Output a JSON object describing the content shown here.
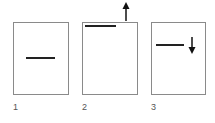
{
  "panels": [
    {
      "label": "1",
      "line_position": "middle",
      "arrow": "none"
    },
    {
      "label": "2",
      "line_position": "top",
      "arrow": "up"
    },
    {
      "label": "3",
      "line_position": "upper",
      "arrow": "down"
    }
  ],
  "colors": {
    "border": "#8a8a8a",
    "line": "#222222",
    "arrow": "#111111",
    "label": "#555555"
  }
}
